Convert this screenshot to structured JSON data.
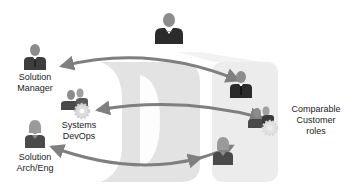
{
  "diagram": {
    "type": "role-mapping",
    "colors": {
      "arrow": "#7f7f7f",
      "person_head": "#8c8c8c",
      "person_body": "#4a4a4a",
      "manager_body": "#2b2b2b",
      "gear": "#d9d9d9",
      "band": "#e6e6e6",
      "panel": "#ececec",
      "text": "#222222"
    },
    "top_figure": {
      "icon": "executive-person-icon"
    },
    "left_roles": [
      {
        "label_lines": [
          "Solution",
          "Manager"
        ],
        "icon": "manager-person-icon"
      },
      {
        "label_lines": [
          "Systems",
          "DevOps"
        ],
        "icon": "team-with-gear-icon"
      },
      {
        "label_lines": [
          "Solution",
          "Arch/Eng"
        ],
        "icon": "female-person-icon"
      }
    ],
    "right_panel": {
      "label_lines": [
        "Comparable",
        "Customer",
        "roles"
      ],
      "roles": [
        {
          "icon": "manager-person-icon"
        },
        {
          "icon": "team-with-gear-icon"
        },
        {
          "icon": "female-person-icon"
        }
      ]
    },
    "connections": [
      {
        "from": "Solution Manager",
        "to": "Customer manager",
        "direction": "bidirectional"
      },
      {
        "from": "Systems DevOps",
        "to": "Customer team",
        "direction": "bidirectional"
      },
      {
        "from": "Solution Arch/Eng",
        "to": "Customer engineer",
        "direction": "bidirectional"
      }
    ]
  }
}
